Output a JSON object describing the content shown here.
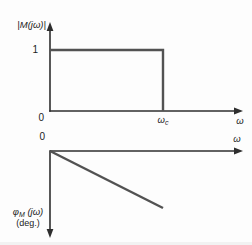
{
  "figure": {
    "top_plot": {
      "ylabel": "|M(jω)|",
      "ytick_1": "1",
      "origin": "0",
      "xtick_cutoff_base": "ω",
      "xtick_cutoff_sub": "c",
      "xlabel": "ω"
    },
    "bottom_plot": {
      "origin": "0",
      "xlabel": "ω",
      "ylabel_phi": "φ",
      "ylabel_sub": "M",
      "ylabel_rest": " (jω)",
      "ylabel_units": "(deg.)"
    }
  },
  "colors": {
    "background": "#fdfdfd",
    "axis": "#2e2e2e",
    "curve": "#525252",
    "text": "#1c1c1c"
  },
  "chart_data": [
    {
      "type": "line",
      "title": "|M(jω)| vs ω (ideal magnitude response)",
      "xlabel": "ω",
      "ylabel": "|M(jω)|",
      "x_ticks": [
        "0",
        "ωc"
      ],
      "y_ticks": [
        "1"
      ],
      "x_units": "multiples of cutoff ωc",
      "ylim": [
        0,
        1
      ],
      "grid": false,
      "series": [
        {
          "name": "|M(jω)|",
          "points": [
            [
              0,
              1
            ],
            [
              1,
              1
            ],
            [
              1,
              0
            ]
          ],
          "note": "Magnitude equals 1 from ω = 0 to ω = ωc, then drops vertically to 0 at ωc"
        }
      ]
    },
    {
      "type": "line",
      "title": "φM(jω) vs ω (linear phase response)",
      "xlabel": "ω",
      "ylabel": "φM(jω) (deg.)",
      "x_ticks": [
        "0"
      ],
      "y_ticks": [],
      "x_units": "multiples of cutoff ωc",
      "y_axis_direction": "downward (negative phase)",
      "grid": false,
      "series": [
        {
          "name": "φM(jω)",
          "points": [
            [
              0,
              0
            ],
            [
              1,
              -1
            ]
          ],
          "note": "Phase decreases linearly from 0, reaching its maximum negative value at ωc; y in normalized units (no scale shown)"
        }
      ]
    }
  ]
}
